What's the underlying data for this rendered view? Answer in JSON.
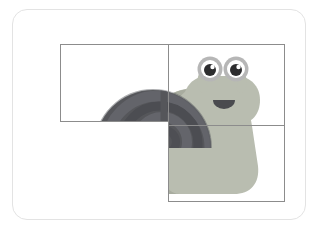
{
  "scene": {
    "kind": "jigsaw-puzzle-card",
    "subject": "cartoon-snail",
    "card": {
      "background": "#ffffff",
      "border_color": "#e3e3e3",
      "corner_radius_px": 15,
      "x": 12,
      "y": 9,
      "width": 294,
      "height": 211
    },
    "puzzle": {
      "x": 47,
      "y": 34,
      "width": 225,
      "height": 158,
      "grid_stroke_color": "#8c8c8c",
      "layout": "L-shaped arrangement of rectangular tiles",
      "tile_count": 4,
      "tiles": [
        {
          "name": "top-left",
          "x": 0,
          "y": 0,
          "width": 108,
          "height": 77,
          "filled": true
        },
        {
          "name": "top-right",
          "x": 108,
          "y": 0,
          "width": 117,
          "height": 81,
          "filled": true
        },
        {
          "name": "bottom-right",
          "x": 108,
          "y": 81,
          "width": 117,
          "height": 76,
          "filled": true
        },
        {
          "name": "bottom-left",
          "x": 0,
          "y": 77,
          "width": 108,
          "height": 81,
          "filled": false
        }
      ],
      "missing_tile": "bottom-left"
    },
    "colors": {
      "shell_dark": "#555558",
      "shell_mid": "#5f6064",
      "shell_band": "#4a4b4f",
      "shell_light": "#6c6d71",
      "body_light": "#b9bdb0",
      "body_mid": "#a9ada0",
      "body_shadow": "#9a9e92",
      "eye_ring": "#b6b6b6",
      "eye_white": "#ffffff",
      "pupil": "#2d2d2f",
      "mouth": "#4a4b4f",
      "page_background": "#ffffff"
    },
    "snail": {
      "shell": {
        "shape": "spiral",
        "bands": 3,
        "center_x": 128,
        "center_y": 82
      },
      "body": {
        "shape": "foot-and-head",
        "facing": "right"
      },
      "eyes": [
        {
          "name": "left-eye",
          "cx": 160,
          "cy": 31,
          "r": 11.5,
          "pupil_r": 6
        },
        {
          "name": "right-eye",
          "cx": 184,
          "cy": 31,
          "r": 11.5,
          "pupil_r": 6
        }
      ],
      "mouth": {
        "cx": 171,
        "cy": 58,
        "rx": 9,
        "ry": 6,
        "expression": "smile"
      },
      "antennae": 2
    }
  }
}
